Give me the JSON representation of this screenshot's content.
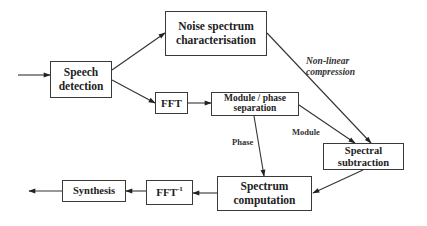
{
  "diagram": {
    "type": "block-diagram",
    "nodes": [
      {
        "id": "speech_detection",
        "label_line1": "Speech",
        "label_line2": "detection"
      },
      {
        "id": "noise_spectrum",
        "label_line1": "Noise spectrum",
        "label_line2": "characterisation"
      },
      {
        "id": "fft",
        "label": "FFT"
      },
      {
        "id": "module_phase",
        "label_line1": "Module / phase",
        "label_line2": "separation"
      },
      {
        "id": "spectral_subtraction",
        "label_line1": "Spectral",
        "label_line2": "subtraction"
      },
      {
        "id": "spectrum_computation",
        "label_line1": "Spectrum",
        "label_line2": "computation"
      },
      {
        "id": "ifft",
        "label": "FFT",
        "label_sup": "-1"
      },
      {
        "id": "synthesis",
        "label": "Synthesis"
      }
    ],
    "edge_labels": {
      "nonlinear_line1": "Non-linear",
      "nonlinear_line2": "compression",
      "module": "Module",
      "phase": "Phase"
    },
    "edges": [
      {
        "from": "input",
        "to": "speech_detection"
      },
      {
        "from": "speech_detection",
        "to": "noise_spectrum"
      },
      {
        "from": "speech_detection",
        "to": "fft"
      },
      {
        "from": "fft",
        "to": "module_phase"
      },
      {
        "from": "noise_spectrum",
        "to": "spectral_subtraction",
        "label": "Non-linear compression"
      },
      {
        "from": "module_phase",
        "to": "spectral_subtraction",
        "label": "Module"
      },
      {
        "from": "module_phase",
        "to": "spectrum_computation",
        "label": "Phase"
      },
      {
        "from": "spectral_subtraction",
        "to": "spectrum_computation"
      },
      {
        "from": "spectrum_computation",
        "to": "ifft"
      },
      {
        "from": "ifft",
        "to": "synthesis"
      },
      {
        "from": "synthesis",
        "to": "output"
      }
    ]
  }
}
